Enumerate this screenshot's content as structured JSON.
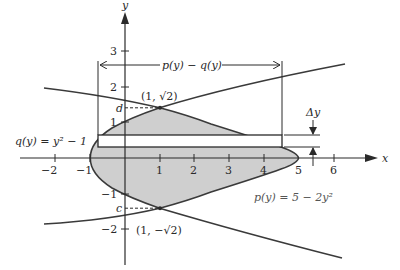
{
  "axes": {
    "x_label": "x",
    "y_label": "y",
    "x_ticks": [
      "−2",
      "−1",
      "1",
      "2",
      "3",
      "4",
      "5",
      "6"
    ],
    "y_ticks": [
      "3",
      "2",
      "1",
      "−1",
      "−2"
    ]
  },
  "curves": {
    "q_label": "q(y) = y² − 1",
    "p_label": "p(y) = 5 − 2y²"
  },
  "annotations": {
    "width_label": "p(y) − q(y)",
    "delta_label": "Δy",
    "top_point": "(1, √2)",
    "bottom_point": "(1, −√2)",
    "d_label": "d",
    "c_label": "c"
  },
  "colors": {
    "region_fill": "#cfcfcf",
    "stroke": "#3a3a3a",
    "strip_fill": "#ffffff"
  }
}
